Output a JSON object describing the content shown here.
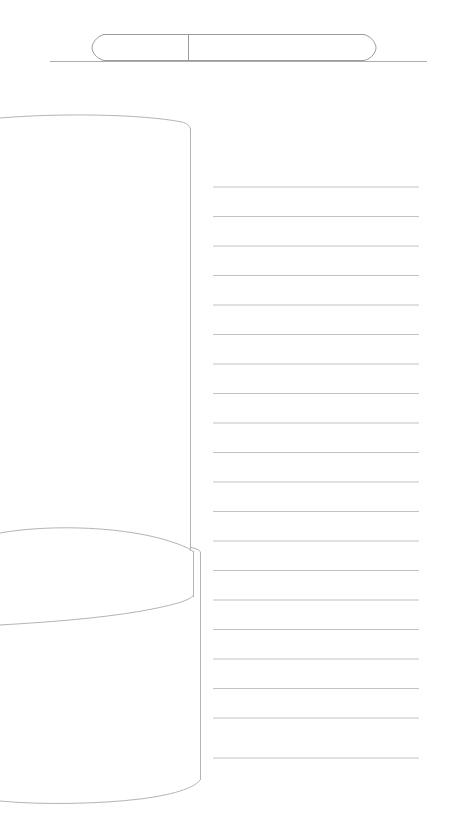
{
  "document": {
    "title": "Untitled line drawing",
    "canvas": {
      "width": 451,
      "height": 839,
      "background": "#ffffff"
    }
  },
  "palette": {
    "stroke": "#9a9a9a",
    "stroke_soft": "#b4b4b4",
    "rule": "#c2c2c2",
    "baseline": "#aeaeae",
    "background": "#ffffff"
  },
  "shapes": {
    "top_baseline": {
      "name": "top-baseline",
      "label": "Horizontal baseline",
      "x1": 50,
      "y1": 61,
      "x2": 427,
      "y2": 61
    },
    "capsule": {
      "name": "capsule",
      "label": "Capsule with divider",
      "left": 94,
      "right": 374,
      "top": 34,
      "bottom": 60,
      "divider_x": 188,
      "cells": 2
    },
    "upper_panel": {
      "name": "upper-panel",
      "label": "Curved top panel",
      "edge_x": 190,
      "top_left_y": 117,
      "apex_x": 180,
      "apex_y": 121,
      "join_y": 128,
      "bottom_y": 551
    },
    "lower_panel": {
      "name": "lower-panel",
      "label": "Curved bottom panel",
      "edge_x": 200,
      "top_y": 547,
      "bottom_y": 780,
      "base_left_y": 788,
      "base_join_y": 780
    },
    "lens": {
      "name": "lens-shape",
      "label": "Lens / eye shape",
      "left": 0,
      "right": 193,
      "top_arc_y": 528,
      "bottom_arc_y": 623,
      "mid_y": 575
    }
  },
  "ruled_area": {
    "name": "ruled-lines",
    "label": "Ruled writing lines",
    "x_start": 213,
    "x_end": 419,
    "first_y": 187,
    "spacing": 29.5,
    "count": 20,
    "lines": [
      187,
      216.5,
      246,
      275.5,
      305,
      334.5,
      364,
      393.5,
      423,
      452.5,
      482,
      511.5,
      541,
      570.5,
      600,
      629.5,
      659,
      688.5,
      718,
      758
    ]
  }
}
